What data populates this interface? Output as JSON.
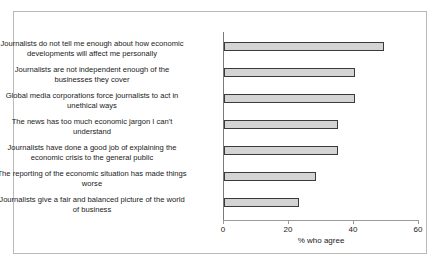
{
  "chart_data": {
    "type": "bar",
    "orientation": "horizontal",
    "title": "",
    "xlabel": "% who agree",
    "ylabel": "",
    "xlim": [
      0,
      60
    ],
    "xticks": [
      0,
      20,
      40,
      60
    ],
    "xtick_labels": [
      "0",
      "20",
      "40",
      "60"
    ],
    "grid": false,
    "legend": false,
    "categories": [
      "Journalists do not tell me enough about how economic developments will affect me personally",
      "Journalists are not independent enough of the businesses they cover",
      "Global media corporations force journalists to act in unethical ways",
      "The news has too much economic jargon I can't understand",
      "Journalists have done a good job of explaining the economic crisis to the general public",
      "The reporting of the economic situation has made things worse",
      "Journalists give a fair and balanced picture of the world of business"
    ],
    "values": [
      49,
      40,
      40,
      35,
      35,
      28,
      23
    ],
    "bar_fill_color": "#d4d4d4",
    "bar_border_color": "#3a3a3a",
    "axis_color": "#9a9a9a",
    "frame_color": "#b9b9b9",
    "background_color": "#ffffff"
  }
}
